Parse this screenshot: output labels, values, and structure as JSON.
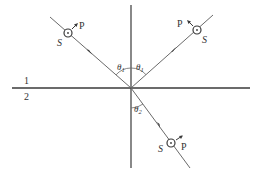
{
  "diagram": {
    "title": "",
    "media": {
      "medium_1_label": "1",
      "medium_2_label": "2"
    },
    "angles": {
      "incident_label": "θ1",
      "incident_sub": "1",
      "reflected_label": "θ1",
      "reflected_sub": "1",
      "refracted_label": "θ2",
      "refracted_sub": "2"
    },
    "rays": [
      {
        "name": "incident",
        "s_label": "S",
        "p_label": "P"
      },
      {
        "name": "reflected",
        "s_label": "S",
        "p_label": "P"
      },
      {
        "name": "refracted",
        "s_label": "S",
        "p_label": "P"
      }
    ],
    "colors": {
      "line": "#3a3a3a",
      "ray": "#6a6a6a",
      "text": "#333333"
    }
  }
}
